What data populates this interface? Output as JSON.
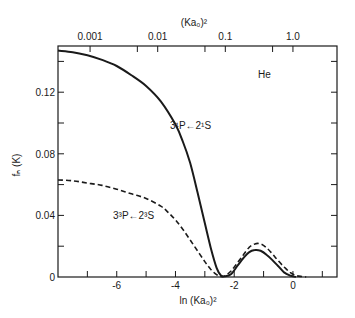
{
  "chart_data": {
    "type": "line",
    "title": "",
    "xlabel": "ln (Ka₀)²",
    "ylabel": "fₙ (K)",
    "top_xlabel": "(Ka₀)²",
    "xlim": [
      -8,
      1.5
    ],
    "ylim": [
      0,
      0.15
    ],
    "grid": false,
    "x_ticks": [
      -7,
      -6,
      -5,
      -4,
      -3,
      -2,
      -1,
      0,
      1
    ],
    "x_tick_labels": [
      {
        "value": -6,
        "label": "-6"
      },
      {
        "value": -4,
        "label": "-4"
      },
      {
        "value": -2,
        "label": "-2"
      },
      {
        "value": 0,
        "label": "0"
      }
    ],
    "y_ticks": [
      0.02,
      0.04,
      0.06,
      0.08,
      0.1,
      0.12,
      0.14
    ],
    "y_tick_labels": [
      {
        "value": 0,
        "label": "0"
      },
      {
        "value": 0.04,
        "label": "0.04"
      },
      {
        "value": 0.08,
        "label": "0.08"
      },
      {
        "value": 0.12,
        "label": "0.12"
      }
    ],
    "top_axis": {
      "scale": "log",
      "ticks": [
        0.001,
        0.005,
        0.01,
        0.05,
        0.1,
        0.5,
        1.0
      ],
      "tick_labels": [
        {
          "value": 0.001,
          "label": "0.001"
        },
        {
          "value": 0.01,
          "label": "0.01"
        },
        {
          "value": 0.1,
          "label": "0.1"
        },
        {
          "value": 1.0,
          "label": "1.0"
        }
      ]
    },
    "annotations": [
      {
        "text": "He",
        "x": 0.0,
        "y": 0.132
      },
      {
        "text": "3¹P←2¹S",
        "x": -3.5,
        "y": 0.095
      },
      {
        "text": "3³P←2³S",
        "x": -6.4,
        "y": 0.04
      }
    ],
    "series": [
      {
        "name": "3¹P←2¹S",
        "style": "solid",
        "x": [
          -8.0,
          -7.5,
          -7.0,
          -6.5,
          -6.0,
          -5.5,
          -5.0,
          -4.5,
          -4.0,
          -3.75,
          -3.5,
          -3.25,
          -3.0,
          -2.8,
          -2.6,
          -2.45,
          -2.3,
          -2.1,
          -1.9,
          -1.7,
          -1.5,
          -1.3,
          -1.1,
          -0.9,
          -0.7,
          -0.5,
          -0.3,
          -0.1,
          0.1
        ],
        "y": [
          0.147,
          0.146,
          0.144,
          0.141,
          0.137,
          0.131,
          0.124,
          0.114,
          0.099,
          0.088,
          0.074,
          0.055,
          0.035,
          0.019,
          0.006,
          0.001,
          0.0005,
          0.002,
          0.007,
          0.012,
          0.016,
          0.0175,
          0.017,
          0.0145,
          0.011,
          0.007,
          0.003,
          0.001,
          0.0
        ]
      },
      {
        "name": "3³P←2³S",
        "style": "dashed",
        "x": [
          -8.0,
          -7.5,
          -7.0,
          -6.5,
          -6.0,
          -5.5,
          -5.0,
          -4.5,
          -4.25,
          -4.0,
          -3.75,
          -3.5,
          -3.25,
          -3.0,
          -2.8,
          -2.6,
          -2.45,
          -2.3,
          -2.1,
          -1.9,
          -1.7,
          -1.5,
          -1.3,
          -1.1,
          -0.9,
          -0.7,
          -0.5,
          -0.3,
          -0.1,
          0.1,
          0.3,
          0.45
        ],
        "y": [
          0.063,
          0.0625,
          0.061,
          0.0595,
          0.057,
          0.054,
          0.051,
          0.046,
          0.042,
          0.037,
          0.031,
          0.024,
          0.017,
          0.01,
          0.005,
          0.0015,
          0.0003,
          0.0008,
          0.004,
          0.009,
          0.014,
          0.019,
          0.0215,
          0.0215,
          0.019,
          0.015,
          0.0105,
          0.0065,
          0.003,
          0.001,
          0.0003,
          0.0
        ]
      }
    ]
  }
}
